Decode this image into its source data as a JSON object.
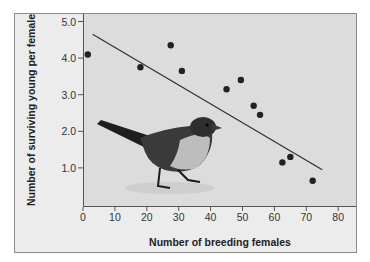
{
  "chart_data": {
    "type": "scatter",
    "title": "",
    "xlabel": "Number of breeding females",
    "ylabel": "Number of surviving young per female",
    "xlim": [
      0,
      85
    ],
    "ylim": [
      0,
      5.3
    ],
    "grid": false,
    "legend": null,
    "x_ticks": [
      "0",
      "10",
      "20",
      "30",
      "40",
      "50",
      "60",
      "70",
      "80"
    ],
    "y_ticks": [
      "1.0",
      "2.0",
      "3.0",
      "4.0",
      "5.0"
    ],
    "series": [
      {
        "name": "observations",
        "points": [
          {
            "x": 1.5,
            "y": 4.1
          },
          {
            "x": 18,
            "y": 3.75
          },
          {
            "x": 27.5,
            "y": 4.35
          },
          {
            "x": 31,
            "y": 3.65
          },
          {
            "x": 45,
            "y": 3.15
          },
          {
            "x": 49.5,
            "y": 3.4
          },
          {
            "x": 53.5,
            "y": 2.7
          },
          {
            "x": 55.5,
            "y": 2.45
          },
          {
            "x": 62.5,
            "y": 1.15
          },
          {
            "x": 65,
            "y": 1.3
          },
          {
            "x": 72,
            "y": 0.65
          }
        ]
      }
    ],
    "trend_line": {
      "x1": 3,
      "y1": 4.65,
      "x2": 75,
      "y2": 0.95
    },
    "annotations": [
      "bird illustration (song sparrow) inset in lower-left of plot"
    ]
  },
  "colors": {
    "page_bg": "#ffffff",
    "frame_bg": "#ececec",
    "plot_bg": "#dcdcdc",
    "point": "#222222",
    "line": "#333333"
  }
}
